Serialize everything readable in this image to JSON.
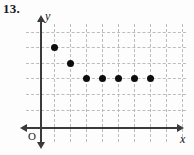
{
  "problem": {
    "number_label": "13."
  },
  "axes": {
    "x_label": "x",
    "y_label": "y",
    "origin_label": "O",
    "x_axis_y_px": 127,
    "y_axis_x_px": 40,
    "arrows": [
      "x-right",
      "x-left",
      "y-up",
      "y-down"
    ],
    "axis_color": "#3a3a3a"
  },
  "grid": {
    "color": "#b9b9b9",
    "style": "dashed",
    "vertical_x_px": [
      54,
      70,
      86,
      102,
      118,
      134,
      150,
      166,
      182
    ],
    "horizontal_y_px": [
      32,
      47,
      63,
      78,
      94,
      110
    ]
  },
  "chart_data": {
    "type": "scatter",
    "title": "13.",
    "xlabel": "x",
    "ylabel": "y",
    "grid": true,
    "legend": "none",
    "xlim": [
      0,
      10
    ],
    "ylim": [
      0,
      7
    ],
    "point_color": "#0d0d0d",
    "x": [
      1,
      2,
      3,
      4,
      5,
      6,
      7
    ],
    "y": [
      5,
      4,
      3,
      3,
      3,
      3,
      3
    ],
    "points_px": [
      {
        "x": 54,
        "y": 47
      },
      {
        "x": 70,
        "y": 63
      },
      {
        "x": 86,
        "y": 78
      },
      {
        "x": 102,
        "y": 78
      },
      {
        "x": 118,
        "y": 78
      },
      {
        "x": 134,
        "y": 78
      },
      {
        "x": 150,
        "y": 78
      }
    ]
  }
}
